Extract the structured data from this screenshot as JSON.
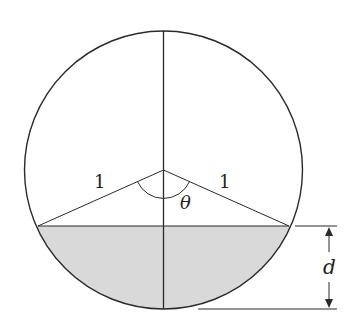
{
  "diagram": {
    "type": "circle-segment",
    "labels": {
      "radius_left": "1",
      "radius_right": "1",
      "angle": "θ",
      "depth": "d"
    },
    "colors": {
      "stroke": "#2a2a2a",
      "shaded": "#d9d9d9",
      "background": "#ffffff"
    }
  }
}
